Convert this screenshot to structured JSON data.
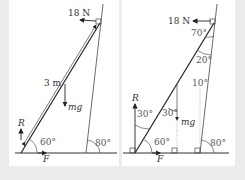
{
  "left": {
    "horizontal_force": "18 N",
    "ladder_length": "3 m",
    "weight": "mg",
    "reaction": "R",
    "friction": "F",
    "ladder_angle": "60°",
    "wall_angle": "80°"
  },
  "right": {
    "horizontal_force": "18 N",
    "top_angle": "70°",
    "wall_ladder_angle": "20°",
    "wall_vertical_angle": "10°",
    "mg_ladder_angle": "30°",
    "r_ladder_angle": "30°",
    "weight": "mg",
    "reaction": "R",
    "friction": "F",
    "ladder_angle": "60°",
    "wall_angle": "80°"
  },
  "colors": {
    "background": "#ececec",
    "panel": "#ffffff",
    "line": "#333333",
    "construction": "#999999"
  }
}
